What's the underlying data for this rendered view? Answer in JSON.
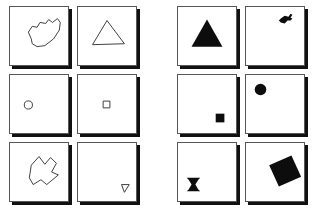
{
  "board": {
    "title": "Shape card array",
    "background_color": "#ffffff",
    "card_border_color": "#575757",
    "card_shadow_color": "#111111",
    "outline_stroke_color": "#3a3a3a",
    "fill_color": "#0d0d0d",
    "rows": 3,
    "columns": 2,
    "panel_count": 2
  },
  "panels": [
    {
      "id": "outline-panel",
      "name": "left-panel-outline-shapes",
      "style": "outline",
      "cells": [
        {
          "id": "cell-1-1",
          "shape_name": "blob-outline",
          "label": "Irregular blob",
          "fill": "none",
          "position": "center",
          "points": "22,33 19,26 23,20 28,21 31,16 37,17 40,13 44,16 49,12 52,16 51,24 45,33 36,40 28,41 23,38"
        },
        {
          "id": "cell-1-2",
          "shape_name": "triangle-outline",
          "label": "Triangle",
          "fill": "none",
          "position": "center",
          "points": "30,14 48,38 15,39"
        },
        {
          "id": "cell-2-1",
          "shape_name": "circle-outline",
          "label": "Small circle",
          "fill": "none",
          "position": "left-center",
          "cx": 19,
          "cy": 31,
          "r": 4.2
        },
        {
          "id": "cell-2-2",
          "shape_name": "square-outline",
          "label": "Small square",
          "fill": "none",
          "position": "center",
          "x": 26,
          "y": 27,
          "w": 7,
          "h": 7
        },
        {
          "id": "cell-3-1",
          "shape_name": "arrow-polygon-outline",
          "label": "Concave arrow polygon",
          "fill": "none",
          "position": "center",
          "points": "22,23 30,14 36,22 42,15 48,21 43,30 50,33 38,43 32,38 24,43 20,36"
        },
        {
          "id": "cell-3-2",
          "shape_name": "tiny-triangle-outline",
          "label": "Tiny triangle",
          "fill": "none",
          "position": "bottom-right",
          "points": "45,43 53,43 48,51"
        }
      ]
    },
    {
      "id": "filled-panel",
      "name": "right-panel-filled-shapes",
      "style": "filled",
      "cells": [
        {
          "id": "cell-1-1",
          "shape_name": "triangle-filled",
          "label": "Filled triangle",
          "fill": "solid",
          "position": "center",
          "points": "30,13 46,41 14,41"
        },
        {
          "id": "cell-1-2",
          "shape_name": "key-filled",
          "label": "Filled key shape",
          "fill": "solid",
          "position": "top-right",
          "points": "36,12 40,9 44,10 46,7 48,8 46,11 48,12 46,14 43,14 40,17 36,16 34,14"
        },
        {
          "id": "cell-2-1",
          "shape_name": "square-filled",
          "label": "Filled square",
          "fill": "solid",
          "position": "bottom-right",
          "x": 39,
          "y": 40,
          "w": 9,
          "h": 9
        },
        {
          "id": "cell-2-2",
          "shape_name": "circle-filled",
          "label": "Filled circle",
          "fill": "solid",
          "position": "top-left",
          "cx": 15,
          "cy": 15,
          "r": 6
        },
        {
          "id": "cell-3-1",
          "shape_name": "hourglass-filled",
          "label": "Filled hourglass",
          "fill": "solid",
          "position": "bottom-left",
          "points": "9,36 23,36 21,38 18,43 21,48 23,50 9,50 11,48 14,43 11,38"
        },
        {
          "id": "cell-3-2",
          "shape_name": "rotated-square-filled",
          "label": "Filled rotated square",
          "fill": "solid",
          "position": "center",
          "points": "24,23 47,13 57,35 34,45"
        }
      ]
    }
  ]
}
